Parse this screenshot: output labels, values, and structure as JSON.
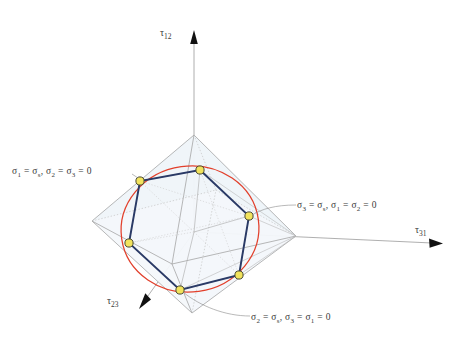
{
  "figure": {
    "title": "",
    "type": "3d-yield-surface-diagram",
    "axes": [
      {
        "name": "tau-12",
        "label_html": "τ",
        "sub": "12",
        "direction": "up",
        "tip": [
          194,
          34
        ],
        "tail": [
          194,
          232
        ]
      },
      {
        "name": "tau-31",
        "label_html": "τ",
        "sub": "31",
        "direction": "right",
        "tip": [
          440,
          240
        ],
        "tail": [
          194,
          232
        ]
      },
      {
        "name": "tau-23",
        "label_html": "τ",
        "sub": "23",
        "direction": "down-left-front",
        "tip": [
          152,
          308
        ],
        "tail": [
          194,
          232
        ]
      }
    ],
    "annotations": [
      {
        "name": "sigma1-label",
        "text": "σ1 = σs, σ2 = σ3 = 0",
        "position": [
          12,
          166
        ],
        "points_to": [
          140,
          181
        ]
      },
      {
        "name": "sigma3-label",
        "text": "σ3 = σs, σ1 = σ2 = 0",
        "position": [
          297,
          200
        ],
        "points_to": [
          249,
          216
        ]
      },
      {
        "name": "sigma2-label",
        "text": "σ2 = σs, σ3 = σ1 = 0",
        "position": [
          251,
          312
        ],
        "points_to": [
          180,
          290
        ]
      }
    ],
    "colors": {
      "circle": "#e2402c",
      "hexagon": "#2a3a66",
      "vertex_fill": "#f2e35c",
      "vertex_stroke": "#4a4a30",
      "wireframe": "#9a9a9a",
      "wireframe_dotted": "#bdbdbd",
      "face_fill": "#eef4f8",
      "text": "#3a3a3a",
      "leader": "#8a8a8a"
    },
    "octahedron": {
      "name": "tresca-octahedron",
      "apex_top": [
        194,
        135
      ],
      "apex_bottom": [
        192,
        313
      ],
      "apex_left": [
        92,
        221
      ],
      "apex_right": [
        296,
        236
      ],
      "apex_front": [
        172,
        264
      ],
      "apex_back": [
        216,
        190
      ]
    },
    "hexagon": {
      "name": "deviatoric-hexagon",
      "vertices": [
        [
          200,
          170
        ],
        [
          249,
          216
        ],
        [
          239,
          275
        ],
        [
          180,
          290
        ],
        [
          129,
          243
        ],
        [
          140,
          181
        ]
      ]
    },
    "circle": {
      "name": "von-mises-circle",
      "center": [
        190,
        229
      ],
      "rx": 69,
      "ry": 63,
      "rotation_deg": -8
    }
  },
  "labels": {
    "sigma1": {
      "s1": "σ",
      "sub1": "1",
      "eq1": "=",
      "s2": "σ",
      "sub2": "s",
      "comma": ",",
      "s3": "σ",
      "sub3": "2",
      "eq2": "=",
      "s4": "σ",
      "sub4": "3",
      "eq3": "= 0"
    },
    "sigma3": {
      "s1": "σ",
      "sub1": "3",
      "eq1": "=",
      "s2": "σ",
      "sub2": "s",
      "comma": ",",
      "s3": "σ",
      "sub3": "1",
      "eq2": "=",
      "s4": "σ",
      "sub4": "2",
      "eq3": "= 0"
    },
    "sigma2": {
      "s1": "σ",
      "sub1": "2",
      "eq1": "=",
      "s2": "σ",
      "sub2": "s",
      "comma": ",",
      "s3": "σ",
      "sub3": "3",
      "eq2": "=",
      "s4": "σ",
      "sub4": "1",
      "eq3": "= 0"
    },
    "tau12": {
      "tau": "τ",
      "sub": "12"
    },
    "tau31": {
      "tau": "τ",
      "sub": "31"
    },
    "tau23": {
      "tau": "τ",
      "sub": "23"
    }
  }
}
